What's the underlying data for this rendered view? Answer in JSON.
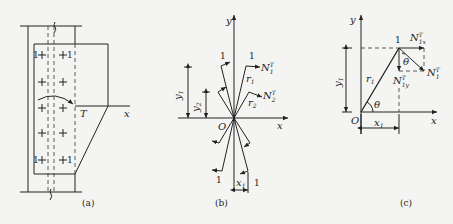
{
  "figures": {
    "a": {
      "caption": "(a)",
      "torque_label": "T",
      "x_axis_label": "x",
      "bolt_label": "1"
    },
    "b": {
      "caption": "(b)",
      "x_axis_label": "x",
      "y_axis_label": "y",
      "origin_label": "O",
      "bolt_label": "1",
      "r1": "r",
      "r1_sub": "1",
      "r2": "r",
      "r2_sub": "2",
      "n1": "N",
      "n1_sup": "T",
      "n1_sub": "1",
      "n2": "N",
      "n2_sup": "T",
      "n2_sub": "2",
      "y1": "y",
      "y1_sub": "1",
      "y2": "y",
      "y2_sub": "2",
      "x1": "x",
      "x1_sub": "1"
    },
    "c": {
      "caption": "(c)",
      "x_axis_label": "x",
      "y_axis_label": "y",
      "origin_label": "O",
      "bolt_label": "1",
      "r1": "r",
      "r1_sub": "1",
      "theta": "θ",
      "n1": "N",
      "n1_sup": "T",
      "n1_sub": "1",
      "n1x": "N",
      "n1x_sup": "T",
      "n1x_sub": "1x",
      "n1y": "N",
      "n1y_sup": "T",
      "n1y_sub": "1y",
      "y1": "y",
      "y1_sub": "1",
      "x1": "x",
      "x1_sub": "1"
    }
  }
}
